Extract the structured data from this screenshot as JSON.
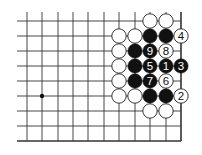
{
  "diagram": {
    "type": "go-board-fragment",
    "colors": {
      "background": "#ffffff",
      "line": "#333333",
      "black_stone": "#111111",
      "white_stone": "#ffffff",
      "stone_outline": "#222222"
    },
    "grid": {
      "columns_x": [
        27,
        42,
        58,
        73,
        88,
        104,
        119,
        135,
        150,
        166,
        181
      ],
      "rows_y": [
        21,
        36,
        51,
        66,
        81,
        96,
        111,
        126,
        141
      ],
      "left_extend_to": 17,
      "top_extend_to": 12,
      "right_edge": true,
      "bottom_edge": true
    },
    "star_points": [
      {
        "col": 1,
        "row": 5
      }
    ],
    "stones": [
      {
        "col": 8,
        "row": 0,
        "color": "white",
        "label": ""
      },
      {
        "col": 9,
        "row": 0,
        "color": "white",
        "label": ""
      },
      {
        "col": 6,
        "row": 1,
        "color": "white",
        "label": ""
      },
      {
        "col": 7,
        "row": 1,
        "color": "white",
        "label": ""
      },
      {
        "col": 8,
        "row": 1,
        "color": "black",
        "label": ""
      },
      {
        "col": 9,
        "row": 1,
        "color": "black",
        "label": ""
      },
      {
        "col": 10,
        "row": 1,
        "color": "white",
        "label": "4"
      },
      {
        "col": 6,
        "row": 2,
        "color": "white",
        "label": ""
      },
      {
        "col": 7,
        "row": 2,
        "color": "black",
        "label": ""
      },
      {
        "col": 8,
        "row": 2,
        "color": "black",
        "label": "9"
      },
      {
        "col": 9,
        "row": 2,
        "color": "white",
        "label": "8"
      },
      {
        "col": 6,
        "row": 3,
        "color": "white",
        "label": ""
      },
      {
        "col": 7,
        "row": 3,
        "color": "black",
        "label": ""
      },
      {
        "col": 8,
        "row": 3,
        "color": "black",
        "label": "5"
      },
      {
        "col": 9,
        "row": 3,
        "color": "black",
        "label": "1"
      },
      {
        "col": 10,
        "row": 3,
        "color": "black",
        "label": "3"
      },
      {
        "col": 6,
        "row": 4,
        "color": "white",
        "label": ""
      },
      {
        "col": 7,
        "row": 4,
        "color": "black",
        "label": ""
      },
      {
        "col": 8,
        "row": 4,
        "color": "black",
        "label": "7"
      },
      {
        "col": 9,
        "row": 4,
        "color": "white",
        "label": "6"
      },
      {
        "col": 6,
        "row": 5,
        "color": "white",
        "label": ""
      },
      {
        "col": 7,
        "row": 5,
        "color": "white",
        "label": ""
      },
      {
        "col": 8,
        "row": 5,
        "color": "black",
        "label": ""
      },
      {
        "col": 9,
        "row": 5,
        "color": "black",
        "label": ""
      },
      {
        "col": 10,
        "row": 5,
        "color": "white",
        "label": "2"
      },
      {
        "col": 8,
        "row": 6,
        "color": "white",
        "label": ""
      },
      {
        "col": 9,
        "row": 6,
        "color": "white",
        "label": ""
      }
    ]
  }
}
